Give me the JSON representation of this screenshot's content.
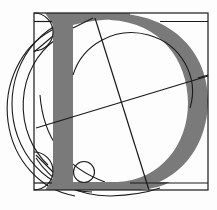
{
  "diagram": {
    "title": "Geometric construction of the letter D",
    "letter": "D",
    "colors": {
      "background": "#fdfdfd",
      "letterform": "#7a7a7a",
      "construction_lines": "#1a1a1a"
    },
    "elements": [
      "outer-square-frame",
      "letter-d-stem",
      "letter-d-bowl",
      "inner-circle",
      "large-left-arcs",
      "diagonal-crosshair",
      "small-corner-circles"
    ]
  }
}
